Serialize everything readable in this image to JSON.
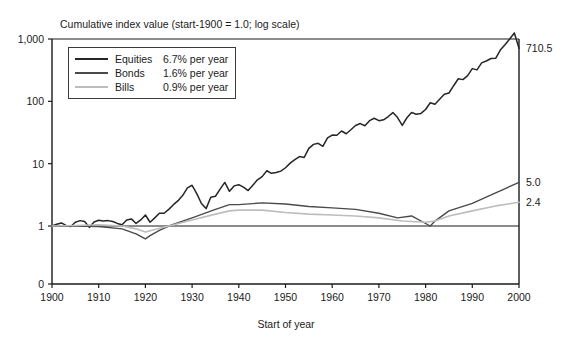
{
  "chart_data": {
    "type": "line",
    "title": "Cumulative index value (start-1900 = 1.0; log scale)",
    "xlabel": "Start of year",
    "ylabel": "",
    "yscale": "log",
    "ylim": [
      1,
      1000
    ],
    "xlim": [
      1900,
      2000
    ],
    "yticks": [
      "1,000",
      "100",
      "10",
      "1",
      "0"
    ],
    "ytick_values": [
      1000,
      100,
      10,
      1,
      0
    ],
    "xticks": [
      "1900",
      "1910",
      "1920",
      "1930",
      "1940",
      "1950",
      "1960",
      "1970",
      "1980",
      "1990",
      "2000"
    ],
    "grid": false,
    "legend_position": "upper left",
    "end_labels": [
      {
        "name": "Equities",
        "value": "710.5"
      },
      {
        "name": "Bonds",
        "value": "5.0"
      },
      {
        "name": "Bills",
        "value": "2.4"
      }
    ],
    "series": [
      {
        "name": "Equities",
        "rate_label": "6.7% per year",
        "color": "#262626",
        "final_value": 710.5,
        "x": [
          1900,
          1901,
          1902,
          1903,
          1904,
          1905,
          1906,
          1907,
          1908,
          1909,
          1910,
          1911,
          1912,
          1913,
          1914,
          1915,
          1916,
          1917,
          1918,
          1919,
          1920,
          1921,
          1922,
          1923,
          1924,
          1925,
          1926,
          1927,
          1928,
          1929,
          1930,
          1931,
          1932,
          1933,
          1934,
          1935,
          1936,
          1937,
          1938,
          1939,
          1940,
          1941,
          1942,
          1943,
          1944,
          1945,
          1946,
          1947,
          1948,
          1949,
          1950,
          1951,
          1952,
          1953,
          1954,
          1955,
          1956,
          1957,
          1958,
          1959,
          1960,
          1961,
          1962,
          1963,
          1964,
          1965,
          1966,
          1967,
          1968,
          1969,
          1970,
          1971,
          1972,
          1973,
          1974,
          1975,
          1976,
          1977,
          1978,
          1979,
          1980,
          1981,
          1982,
          1983,
          1984,
          1985,
          1986,
          1987,
          1988,
          1989,
          1990,
          1991,
          1992,
          1993,
          1994,
          1995,
          1996,
          1997,
          1998,
          1999,
          2000
        ],
        "values": [
          1.0,
          1.07,
          1.12,
          1.02,
          0.98,
          1.15,
          1.22,
          1.18,
          0.95,
          1.16,
          1.24,
          1.2,
          1.22,
          1.18,
          1.1,
          1.05,
          1.25,
          1.3,
          1.1,
          1.25,
          1.5,
          1.15,
          1.35,
          1.6,
          1.6,
          1.85,
          2.2,
          2.55,
          3.1,
          4.1,
          4.5,
          3.3,
          2.3,
          1.9,
          2.9,
          3.0,
          3.9,
          5.0,
          3.6,
          4.4,
          4.6,
          4.2,
          3.7,
          4.5,
          5.5,
          6.2,
          7.7,
          7.0,
          7.2,
          7.6,
          8.6,
          10.2,
          11.6,
          13.0,
          12.6,
          17.6,
          20.4,
          21.2,
          19.0,
          26.0,
          28.8,
          28.6,
          33.4,
          30.2,
          35.0,
          41.0,
          44.0,
          40.5,
          49.0,
          53.5,
          49.0,
          50.5,
          57.0,
          66.0,
          55.0,
          41.0,
          54.5,
          66.0,
          62.0,
          64.0,
          74.0,
          95.0,
          90.0,
          108.0,
          130.0,
          136.0,
          178.0,
          230.0,
          223.0,
          258.0,
          335.0,
          320.0,
          414.0,
          444.0,
          486.0,
          490.0,
          665.0,
          810.0,
          1000.0,
          1250.0,
          710.5
        ]
      },
      {
        "name": "Bonds",
        "rate_label": "1.6% per year",
        "color": "#4a4a4a",
        "final_value": 5.0,
        "x": [
          1900,
          1905,
          1910,
          1915,
          1918,
          1920,
          1921,
          1923,
          1925,
          1930,
          1935,
          1938,
          1940,
          1945,
          1950,
          1955,
          1960,
          1965,
          1970,
          1974,
          1977,
          1981,
          1982,
          1985,
          1990,
          1995,
          2000
        ],
        "values": [
          1.0,
          1.0,
          0.98,
          0.9,
          0.75,
          0.62,
          0.7,
          0.85,
          1.0,
          1.35,
          1.85,
          2.2,
          2.2,
          2.35,
          2.25,
          2.05,
          1.95,
          1.85,
          1.6,
          1.35,
          1.45,
          1.0,
          1.2,
          1.75,
          2.3,
          3.4,
          5.0
        ]
      },
      {
        "name": "Bills",
        "rate_label": "0.9% per year",
        "color": "#bdbdbd",
        "final_value": 2.4,
        "x": [
          1900,
          1905,
          1910,
          1915,
          1918,
          1920,
          1922,
          1925,
          1930,
          1935,
          1938,
          1940,
          1945,
          1950,
          1955,
          1960,
          1965,
          1970,
          1975,
          1980,
          1982,
          1985,
          1990,
          1995,
          2000
        ],
        "values": [
          1.0,
          1.02,
          1.05,
          1.0,
          0.9,
          0.8,
          0.88,
          1.0,
          1.25,
          1.55,
          1.75,
          1.8,
          1.8,
          1.65,
          1.55,
          1.5,
          1.45,
          1.35,
          1.2,
          1.15,
          1.2,
          1.45,
          1.75,
          2.1,
          2.4
        ]
      }
    ]
  },
  "legend": {
    "rows": [
      {
        "name": "Equities",
        "rate": "6.7% per year"
      },
      {
        "name": "Bonds",
        "rate": "1.6% per year"
      },
      {
        "name": "Bills",
        "rate": "0.9% per year"
      }
    ]
  },
  "colors": {
    "equities": "#262626",
    "bonds": "#4a4a4a",
    "bills": "#bdbdbd",
    "axis": "#1b1b1b",
    "background": "#ffffff"
  }
}
